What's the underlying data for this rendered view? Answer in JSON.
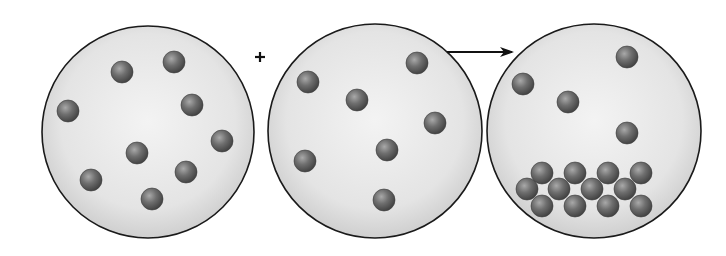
{
  "diagram": {
    "operator_plus": "+",
    "arrow": "right-arrow",
    "colors": {
      "container_fill_center": "#f2f2f2",
      "container_fill_edge": "#d2d2d2",
      "container_stroke": "#1a1a1a",
      "particle_light": "#a8a8a8",
      "particle_dark": "#4a4a4a",
      "symbol": "#111111"
    },
    "particle_radius": 11,
    "containers": [
      {
        "id": "reactant-a",
        "cx": 148,
        "cy": 132,
        "r": 106,
        "particles": [
          [
            122,
            72
          ],
          [
            174,
            62
          ],
          [
            68,
            111
          ],
          [
            192,
            105
          ],
          [
            222,
            141
          ],
          [
            137,
            153
          ],
          [
            186,
            172
          ],
          [
            91,
            180
          ],
          [
            152,
            199
          ]
        ]
      },
      {
        "id": "reactant-b",
        "cx": 375,
        "cy": 131,
        "r": 107,
        "particles": [
          [
            308,
            82
          ],
          [
            417,
            63
          ],
          [
            357,
            100
          ],
          [
            435,
            123
          ],
          [
            305,
            161
          ],
          [
            387,
            150
          ],
          [
            384,
            200
          ]
        ]
      },
      {
        "id": "product",
        "cx": 594,
        "cy": 131,
        "r": 107,
        "particles": [
          [
            523,
            84
          ],
          [
            627,
            57
          ],
          [
            568,
            102
          ],
          [
            627,
            133
          ]
        ],
        "cluster": [
          [
            542,
            173
          ],
          [
            575,
            173
          ],
          [
            608,
            173
          ],
          [
            641,
            173
          ],
          [
            527,
            189
          ],
          [
            559,
            189
          ],
          [
            592,
            189
          ],
          [
            625,
            189
          ],
          [
            542,
            206
          ],
          [
            575,
            206
          ],
          [
            608,
            206
          ],
          [
            641,
            206
          ]
        ]
      }
    ],
    "plus_position": [
      260,
      57
    ],
    "arrow_line": {
      "x1": 447,
      "y1": 52,
      "x2": 512,
      "y2": 52
    }
  }
}
